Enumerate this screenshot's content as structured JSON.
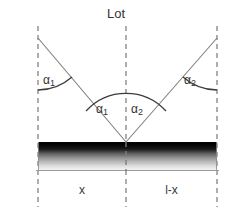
{
  "figure": {
    "title": "Lot",
    "width": 232,
    "height": 211,
    "background": "#ffffff"
  },
  "labels": {
    "angle_left": {
      "symbol": "α",
      "subscript": "1"
    },
    "angle_center_left": {
      "symbol": "α",
      "subscript": "1"
    },
    "angle_center_right": {
      "symbol": "α",
      "subscript": "2"
    },
    "angle_right": {
      "symbol": "α",
      "subscript": "2"
    },
    "segment_left": "x",
    "segment_right": "l-x"
  },
  "colors": {
    "line": "#7a7a7a",
    "dash": "#8c8c8c",
    "arc": "#3c3c3c",
    "text": "#333333",
    "bar_top": "#050505",
    "bar_bottom": "#f2f2f2",
    "bar_border": "#909090"
  },
  "geometry": {
    "left_dash_x": 38,
    "center_dash_x": 126,
    "right_dash_x": 217,
    "apex_y": 142,
    "ray_top_y": 38,
    "bar_top_y": 142,
    "bar_bottom_y": 170,
    "dash_top_y": 26,
    "dash_bottom_y": 207
  }
}
